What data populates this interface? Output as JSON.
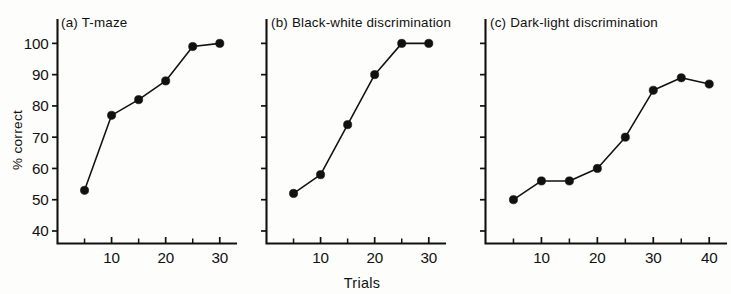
{
  "figure": {
    "background_color": "#fdfdfb",
    "ink_color": "#111111",
    "y_axis_label": "% correct",
    "x_axis_label": "Trials"
  },
  "chart_data": [
    {
      "type": "line",
      "panel": "a",
      "title": "(a)  T-maze",
      "title_prefix": "(a)",
      "title_text": "T-maze",
      "xlabel": "",
      "ylabel": "% correct",
      "x": [
        5,
        10,
        15,
        20,
        25,
        30
      ],
      "values": [
        53,
        77,
        82,
        88,
        99,
        100
      ],
      "xlim": [
        0,
        33
      ],
      "ylim": [
        36,
        103
      ],
      "xticks": [
        5,
        10,
        15,
        20,
        25,
        30
      ],
      "xtick_labels": [
        "",
        "10",
        "",
        "20",
        "",
        "30"
      ],
      "yticks": [
        40,
        50,
        60,
        70,
        80,
        90,
        100
      ],
      "ytick_labels": [
        "40",
        "50",
        "60",
        "70",
        "80",
        "90",
        "100"
      ],
      "grid": false,
      "marker": "filled-circle",
      "legend": "none"
    },
    {
      "type": "line",
      "panel": "b",
      "title": "(b)  Black-white discrimination",
      "title_prefix": "(b)",
      "title_text": "Black-white discrimination",
      "xlabel": "Trials",
      "ylabel": "",
      "x": [
        5,
        10,
        15,
        20,
        25,
        30
      ],
      "values": [
        52,
        58,
        74,
        90,
        100,
        100
      ],
      "xlim": [
        0,
        33
      ],
      "ylim": [
        36,
        103
      ],
      "xticks": [
        5,
        10,
        15,
        20,
        25,
        30
      ],
      "xtick_labels": [
        "",
        "10",
        "",
        "20",
        "",
        "30"
      ],
      "yticks": [
        40,
        50,
        60,
        70,
        80,
        90,
        100
      ],
      "ytick_labels": [
        "",
        "",
        "",
        "",
        "",
        "",
        ""
      ],
      "grid": false,
      "marker": "filled-circle",
      "legend": "none"
    },
    {
      "type": "line",
      "panel": "c",
      "title": "(c)  Dark-light discrimination",
      "title_prefix": "(c)",
      "title_text": "Dark-light discrimination",
      "xlabel": "",
      "ylabel": "",
      "x": [
        5,
        10,
        15,
        20,
        25,
        30,
        35,
        40
      ],
      "values": [
        50,
        56,
        56,
        60,
        70,
        85,
        89,
        87
      ],
      "xlim": [
        0,
        43
      ],
      "ylim": [
        36,
        103
      ],
      "xticks": [
        5,
        10,
        15,
        20,
        25,
        30,
        35,
        40
      ],
      "xtick_labels": [
        "",
        "10",
        "",
        "20",
        "",
        "30",
        "",
        "40"
      ],
      "yticks": [
        40,
        50,
        60,
        70,
        80,
        90,
        100
      ],
      "ytick_labels": [
        "",
        "",
        "",
        "",
        "",
        "",
        ""
      ],
      "grid": false,
      "marker": "filled-circle",
      "legend": "none"
    }
  ]
}
